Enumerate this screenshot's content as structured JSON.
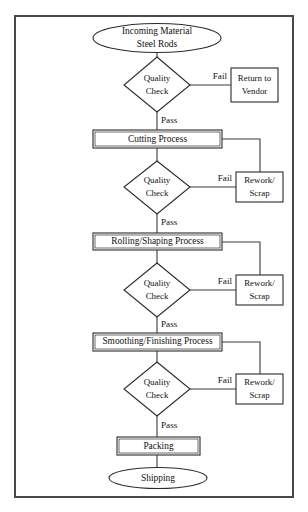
{
  "diagram": {
    "frame": {
      "stroke": "#4a4a4a",
      "fill": "#ffffff"
    },
    "line_color": "#3a3a3a",
    "shape_stroke": "#2b2b2b",
    "text_color": "#111111"
  },
  "nodes": {
    "start": {
      "shape": "ellipse",
      "line1": "Incoming Material",
      "line2": "Steel Rods"
    },
    "qc1": {
      "shape": "diamond",
      "line1": "Quality",
      "line2": "Check"
    },
    "qc2": {
      "shape": "diamond",
      "line1": "Quality",
      "line2": "Check"
    },
    "qc3": {
      "shape": "diamond",
      "line1": "Quality",
      "line2": "Check"
    },
    "qc4": {
      "shape": "diamond",
      "line1": "Quality",
      "line2": "Check"
    },
    "return_vendor": {
      "shape": "rect",
      "line1": "Return to",
      "line2": "Vendor"
    },
    "rework1": {
      "shape": "rect",
      "line1": "Rework/",
      "line2": "Scrap"
    },
    "rework2": {
      "shape": "rect",
      "line1": "Rework/",
      "line2": "Scrap"
    },
    "rework3": {
      "shape": "rect",
      "line1": "Rework/",
      "line2": "Scrap"
    },
    "cutting": {
      "shape": "rect",
      "label": "Cutting Process"
    },
    "rolling": {
      "shape": "rect",
      "label": "Rolling/Shaping Process"
    },
    "smoothing": {
      "shape": "rect",
      "label": "Smoothing/Finishing Process"
    },
    "packing": {
      "shape": "rect",
      "label": "Packing"
    },
    "shipping": {
      "shape": "ellipse",
      "label": "Shipping"
    }
  },
  "edge_labels": {
    "pass1": "Pass",
    "pass2": "Pass",
    "pass3": "Pass",
    "pass4": "Pass",
    "fail1": "Fail",
    "fail2": "Fail",
    "fail3": "Fail",
    "fail4": "Fail"
  }
}
